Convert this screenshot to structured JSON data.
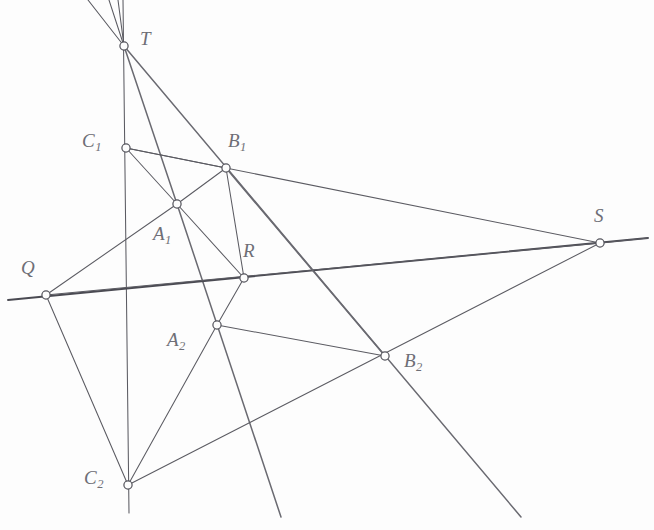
{
  "figure": {
    "canvas": {
      "width": 654,
      "height": 530
    },
    "background_color": "#fdfdfd",
    "line_color": "#5b5b62",
    "vertex_fill_color": "#fdfdfd",
    "vertex_stroke_color": "#55555d",
    "label_color": "#6e6e76"
  },
  "points": [
    {
      "id": "T",
      "label": "T",
      "sub": "",
      "x": 124,
      "y": 46,
      "label_x": 140,
      "label_y": 29
    },
    {
      "id": "C1",
      "label": "C",
      "sub": "1",
      "x": 126,
      "y": 148,
      "label_x": 82,
      "label_y": 131
    },
    {
      "id": "B1",
      "label": "B",
      "sub": "1",
      "x": 226,
      "y": 168,
      "label_x": 228,
      "label_y": 131
    },
    {
      "id": "A1",
      "label": "A",
      "sub": "1",
      "x": 177,
      "y": 204,
      "label_x": 153,
      "label_y": 224
    },
    {
      "id": "Q",
      "label": "Q",
      "sub": "",
      "x": 46,
      "y": 295,
      "label_x": 21,
      "label_y": 258
    },
    {
      "id": "R",
      "label": "R",
      "sub": "",
      "x": 244,
      "y": 278,
      "label_x": 243,
      "label_y": 241
    },
    {
      "id": "S",
      "label": "S",
      "sub": "",
      "x": 600,
      "y": 243,
      "label_x": 594,
      "label_y": 206
    },
    {
      "id": "A2",
      "label": "A",
      "sub": "2",
      "x": 217,
      "y": 325,
      "label_x": 167,
      "label_y": 330
    },
    {
      "id": "B2",
      "label": "B",
      "sub": "2",
      "x": 385,
      "y": 356,
      "label_x": 404,
      "label_y": 351
    },
    {
      "id": "C2",
      "label": "C",
      "sub": "2",
      "x": 128,
      "y": 485,
      "label_x": 84,
      "label_y": 468
    }
  ],
  "segments": [
    {
      "name": "ray-T-upper-left",
      "x1": 124,
      "y1": 46,
      "x2": 88,
      "y2": 0,
      "weight": "thin"
    },
    {
      "name": "ray-T-upper-mid",
      "x1": 124,
      "y1": 46,
      "x2": 109,
      "y2": 0,
      "weight": "thin"
    },
    {
      "name": "ray-T-upper-right",
      "x1": 124,
      "y1": 46,
      "x2": 118,
      "y2": 0,
      "weight": "thin"
    },
    {
      "name": "line-vertical-C1-C2",
      "x1": 123,
      "y1": 0,
      "x2": 129,
      "y2": 513,
      "weight": "thin"
    },
    {
      "name": "segment-T-A1",
      "x1": 124,
      "y1": 46,
      "x2": 177,
      "y2": 204,
      "weight": "med"
    },
    {
      "name": "line-T-B2-bottom",
      "x1": 124,
      "y1": 46,
      "x2": 521,
      "y2": 517,
      "weight": "med"
    },
    {
      "name": "segment-C1-B1",
      "x1": 126,
      "y1": 148,
      "x2": 226,
      "y2": 168,
      "weight": "thin"
    },
    {
      "name": "segment-C1-A1",
      "x1": 126,
      "y1": 148,
      "x2": 177,
      "y2": 204,
      "weight": "thin"
    },
    {
      "name": "line-C1-B1-to-S",
      "x1": 126,
      "y1": 148,
      "x2": 600,
      "y2": 243,
      "weight": "thin"
    },
    {
      "name": "segment-A1-B1",
      "x1": 177,
      "y1": 204,
      "x2": 226,
      "y2": 168,
      "weight": "thin"
    },
    {
      "name": "segment-A1-R",
      "x1": 177,
      "y1": 204,
      "x2": 244,
      "y2": 278,
      "weight": "thin"
    },
    {
      "name": "line-A1-A2-bottom",
      "x1": 177,
      "y1": 204,
      "x2": 281,
      "y2": 517,
      "weight": "med"
    },
    {
      "name": "line-Q-A1-upper",
      "x1": 46,
      "y1": 295,
      "x2": 177,
      "y2": 204,
      "weight": "thin"
    },
    {
      "name": "line-Q-R-S",
      "x1": 8,
      "y1": 300,
      "x2": 648,
      "y2": 238,
      "weight": "thick"
    },
    {
      "name": "line-Q-A2-B2-S",
      "x1": 46,
      "y1": 295,
      "x2": 600,
      "y2": 243,
      "weight": "thin"
    },
    {
      "name": "segment-Q-C2",
      "x1": 46,
      "y1": 295,
      "x2": 128,
      "y2": 485,
      "weight": "thin"
    },
    {
      "name": "segment-R-B1",
      "x1": 244,
      "y1": 278,
      "x2": 226,
      "y2": 168,
      "weight": "thin"
    },
    {
      "name": "segment-R-A2",
      "x1": 244,
      "y1": 278,
      "x2": 217,
      "y2": 325,
      "weight": "thin"
    },
    {
      "name": "line-B1-B2-bottom",
      "x1": 226,
      "y1": 168,
      "x2": 385,
      "y2": 356,
      "weight": "med"
    },
    {
      "name": "segment-A2-B2",
      "x1": 217,
      "y1": 325,
      "x2": 385,
      "y2": 356,
      "weight": "thin"
    },
    {
      "name": "segment-A2-C2",
      "x1": 217,
      "y1": 325,
      "x2": 128,
      "y2": 485,
      "weight": "thin"
    },
    {
      "name": "segment-C2-B2-to-S",
      "x1": 128,
      "y1": 485,
      "x2": 600,
      "y2": 243,
      "weight": "thin"
    },
    {
      "name": "line-S-right-extension",
      "x1": 600,
      "y1": 243,
      "x2": 648,
      "y2": 238,
      "weight": "thin"
    }
  ],
  "labels": {
    "T": "T",
    "C1": "C",
    "B1": "B",
    "A1": "A",
    "Q": "Q",
    "R": "R",
    "S": "S",
    "A2": "A",
    "B2": "B",
    "C2": "C",
    "sub_1": "1",
    "sub_2": "2"
  }
}
